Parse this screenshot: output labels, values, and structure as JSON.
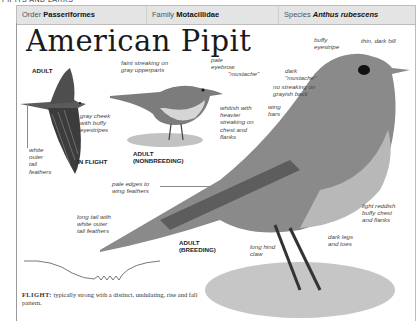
{
  "page": {
    "section_header": "PIPITS AND LARKS"
  },
  "taxonomy": {
    "order_label": "Order",
    "order_value": "Passeriformes",
    "family_label": "Family",
    "family_value": "Motacillidae",
    "species_label": "Species",
    "species_value": "Anthus rubescens"
  },
  "title": "American Pipit",
  "figures": {
    "flying": {
      "age_label": "ADULT",
      "caption": "IN FLIGHT",
      "annotations": [
        "gray cheek\nwith buffy\neyestripes",
        "white\nouter\ntail\nfeathers"
      ]
    },
    "nonbreeding": {
      "caption": "ADULT\n(NONBREEDING)",
      "annotations": [
        "faint streaking on\ngray upperparts",
        "pale\neyebrow",
        "\"mustache\"",
        "whitish with\nheavier\nstreaking on\nchest and\nflanks"
      ]
    },
    "breeding": {
      "caption": "ADULT\n(BREEDING)",
      "annotations": [
        "buffy\neyestripe",
        "thin, dark bill",
        "dark\n\"mustache\"",
        "no streaking on\ngrayish back",
        "wing\nbars",
        "pale edges to\nwing feathers",
        "light reddish\nbuffy chest\nand flanks",
        "long tail with\nwhite outer\ntail feathers",
        "dark legs\nand toes",
        "long hind\nclaw"
      ]
    }
  },
  "flight_pattern": {
    "label": "FLIGHT:",
    "description": " typically strong with a distinct, undulating, rise and fall pattern."
  },
  "colors": {
    "header_bg": "#e4e4e4",
    "bird_dark": "#4a4a4a",
    "bird_mid": "#8c8c8c",
    "bird_light": "#c8c8c8"
  }
}
